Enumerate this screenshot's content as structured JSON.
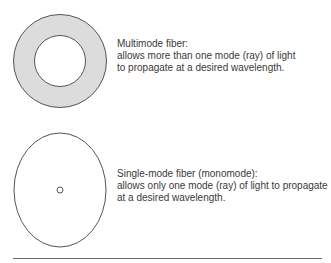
{
  "diagram": {
    "multimode": {
      "title": "Multimode fiber:",
      "line1": "allows more than one mode (ray) of light",
      "line2": "to propagate at a desired wavelength.",
      "shape": {
        "type": "annulus",
        "cx": 60,
        "cy": 61,
        "outer_r": 46.5,
        "inner_r": 25.5,
        "fill": "#dcdcdc",
        "stroke": "#555555"
      }
    },
    "singlemode": {
      "title": "Single-mode fiber (monomode):",
      "line1": "allows only one mode (ray) of light to propagate",
      "line2": "at a desired wavelength.",
      "shape": {
        "type": "ellipse-with-core",
        "cx": 60,
        "cy": 190,
        "rx": 46,
        "ry": 57,
        "core_r": 3,
        "stroke": "#555555"
      }
    }
  }
}
